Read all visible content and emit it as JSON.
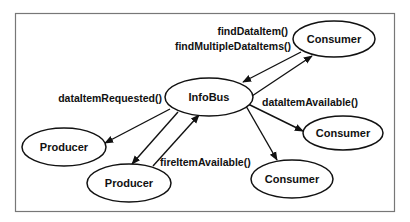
{
  "diagram": {
    "title": "",
    "nodes": {
      "infobus": {
        "label": "InfoBus"
      },
      "consumer_top": {
        "label": "Consumer"
      },
      "consumer_right": {
        "label": "Consumer"
      },
      "consumer_bottom": {
        "label": "Consumer"
      },
      "producer_left": {
        "label": "Producer"
      },
      "producer_bottom": {
        "label": "Producer"
      }
    },
    "edge_labels": {
      "find_data_item": "findDataItem()",
      "find_multiple_data_items": "findMultipleDataItems()",
      "data_item_requested": "dataItemRequested()",
      "data_item_available": "dataItemAvailable()",
      "fire_item_available": "fireItemAvailable()"
    },
    "edges": [
      {
        "from": "consumer_top",
        "to": "infobus"
      },
      {
        "from": "infobus",
        "to": "consumer_top"
      },
      {
        "from": "infobus",
        "to": "consumer_right"
      },
      {
        "from": "infobus",
        "to": "consumer_bottom"
      },
      {
        "from": "infobus",
        "to": "producer_left"
      },
      {
        "from": "infobus",
        "to": "producer_bottom"
      },
      {
        "from": "producer_bottom",
        "to": "infobus"
      }
    ],
    "colors": {
      "stroke": "#111111",
      "frame": "#777777",
      "background": "#ffffff"
    }
  }
}
